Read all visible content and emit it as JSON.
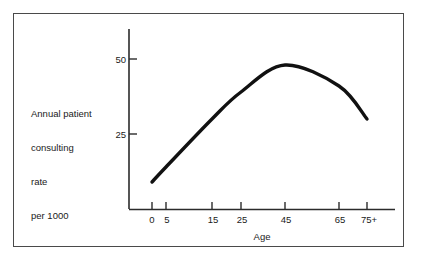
{
  "figure": {
    "frame_color": "#4a4a4a",
    "background": "#ffffff",
    "curve_color": "#111111",
    "axis_color": "#2b2b2b"
  },
  "ylabel_lines": [
    "Annual patient",
    "consulting",
    "rate",
    "per 1000"
  ],
  "axes": {
    "x_title": "Age",
    "y_title": "Annual patient consulting rate per 1000",
    "x_tick_labels": [
      "0",
      "5",
      "15",
      "25",
      "45",
      "65",
      "75+"
    ],
    "y_tick_labels": [
      "25",
      "50"
    ]
  },
  "chart_data": {
    "type": "line",
    "title": "",
    "subtitle": "",
    "xlabel": "Age",
    "ylabel": "Annual patient consulting rate per 1000",
    "categories": [
      "0",
      "5",
      "15",
      "25",
      "45",
      "65",
      "75+"
    ],
    "x": [
      0,
      5,
      15,
      25,
      45,
      65,
      75
    ],
    "values": [
      9,
      14,
      30,
      39,
      48,
      41,
      30
    ],
    "series": [
      {
        "name": "Annual patient consulting rate per 1000",
        "values": [
          9,
          14,
          30,
          39,
          48,
          41,
          30
        ]
      }
    ],
    "xtick_labels": [
      "0",
      "5",
      "15",
      "25",
      "45",
      "65",
      "75+"
    ],
    "ytick_values": [
      25,
      50
    ],
    "ytick_labels": [
      "25",
      "50"
    ],
    "xlim": [
      0,
      75
    ],
    "ylim": [
      0,
      55
    ],
    "grid": false,
    "legend": false,
    "legend_position": "none",
    "annotations": []
  }
}
